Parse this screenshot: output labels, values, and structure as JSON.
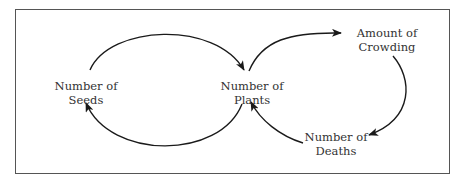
{
  "diagram": {
    "type": "causal-loop",
    "nodes": [
      {
        "id": "seeds",
        "line1": "Number of",
        "line2": "Seeds"
      },
      {
        "id": "plants",
        "line1": "Number of",
        "line2": "Plants"
      },
      {
        "id": "crowding",
        "line1": "Amount of",
        "line2": "Crowding"
      },
      {
        "id": "deaths",
        "line1": "Number of",
        "line2": "Deaths"
      }
    ],
    "edges": [
      {
        "from": "seeds",
        "to": "plants"
      },
      {
        "from": "plants",
        "to": "seeds"
      },
      {
        "from": "plants",
        "to": "crowding"
      },
      {
        "from": "crowding",
        "to": "deaths"
      },
      {
        "from": "deaths",
        "to": "plants"
      }
    ],
    "colors": {
      "line": "#1a1a1a",
      "text": "#333333",
      "border": "#555555"
    }
  }
}
